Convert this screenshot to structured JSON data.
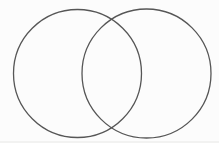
{
  "canvas": {
    "width": 219,
    "height": 143,
    "background": "#fcfcfc",
    "bottom_edge_tint": "#e9e9e8"
  },
  "diagram": {
    "type": "venn",
    "stroke_color": "#565656",
    "stroke_width": 1.3,
    "fill": "none",
    "circles": [
      {
        "name": "left-circle",
        "cx": 77.5,
        "cy": 73.5,
        "r": 64
      },
      {
        "name": "right-circle",
        "cx": 146.5,
        "cy": 73.5,
        "r": 64.5
      }
    ]
  }
}
